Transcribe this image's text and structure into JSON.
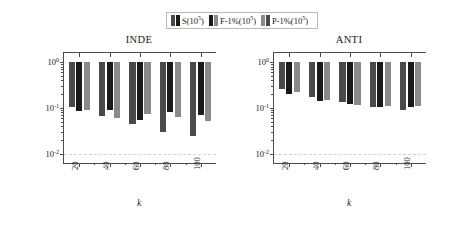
{
  "figure": {
    "legend": {
      "entries": [
        {
          "label": "S(10⁵)",
          "text": "S(10",
          "sup": "5",
          "tail": ")",
          "color": "#4a4a4a",
          "color2": "#1a1a1a"
        },
        {
          "label": "F-1%(10⁵)",
          "text": "F-1%(10",
          "sup": "5",
          "tail": ")",
          "color": "#1a1a1a",
          "color2": "#8a8a8a"
        },
        {
          "label": "P-1%(10⁵)",
          "text": "P-1%(10",
          "sup": "5",
          "tail": ")",
          "color": "#8a8a8a",
          "color2": "#4a4a4a"
        }
      ]
    },
    "ylabel": "regret ratio",
    "xlabel": "k",
    "ytick_labels": [
      "10",
      "10",
      "10"
    ],
    "ytick_exponents": [
      "0",
      "-1",
      "-2"
    ]
  },
  "chart_data": [
    {
      "type": "bar",
      "title": "INDE",
      "xlabel": "k",
      "ylabel": "regret ratio",
      "yscale": "log",
      "ylim": [
        0.00631,
        1.585
      ],
      "ytick_values": [
        1,
        0.1,
        0.01
      ],
      "ytick_labels": [
        "10^0",
        "10^-1",
        "10^-2"
      ],
      "grid": "y-dashed-at-1e-2",
      "legend_position": "above-figure-center",
      "categories": [
        "20",
        "40",
        "60",
        "80",
        "100"
      ],
      "bar_top": 1.0,
      "note": "bars drawn hanging from 1.0 down to the listed value",
      "series": [
        {
          "name": "S(10^5)",
          "color": "#4a4a4a",
          "values": [
            0.105,
            0.068,
            0.044,
            0.03,
            0.025
          ]
        },
        {
          "name": "F-1%(10^5)",
          "color": "#1a1a1a",
          "values": [
            0.088,
            0.09,
            0.056,
            0.081,
            0.07
          ]
        },
        {
          "name": "P-1%(10^5)",
          "color": "#8a8a8a",
          "values": [
            0.089,
            0.061,
            0.074,
            0.064,
            0.052
          ]
        }
      ]
    },
    {
      "type": "bar",
      "title": "ANTI",
      "xlabel": "k",
      "ylabel": "regret ratio",
      "yscale": "log",
      "ylim": [
        0.00631,
        1.585
      ],
      "ytick_values": [
        1,
        0.1,
        0.01
      ],
      "ytick_labels": [
        "10^0",
        "10^-1",
        "10^-2"
      ],
      "grid": "y-dashed-at-1e-2",
      "legend_position": "above-figure-center",
      "categories": [
        "20",
        "40",
        "60",
        "80",
        "100"
      ],
      "bar_top": 1.0,
      "note": "bars drawn hanging from 1.0 down to the listed value",
      "series": [
        {
          "name": "S(10^5)",
          "color": "#4a4a4a",
          "values": [
            0.255,
            0.176,
            0.135,
            0.105,
            0.09
          ]
        },
        {
          "name": "F-1%(10^5)",
          "color": "#1a1a1a",
          "values": [
            0.205,
            0.142,
            0.122,
            0.106,
            0.103
          ]
        },
        {
          "name": "P-1%(10^5)",
          "color": "#8a8a8a",
          "values": [
            0.22,
            0.151,
            0.118,
            0.108,
            0.11
          ]
        }
      ]
    }
  ]
}
